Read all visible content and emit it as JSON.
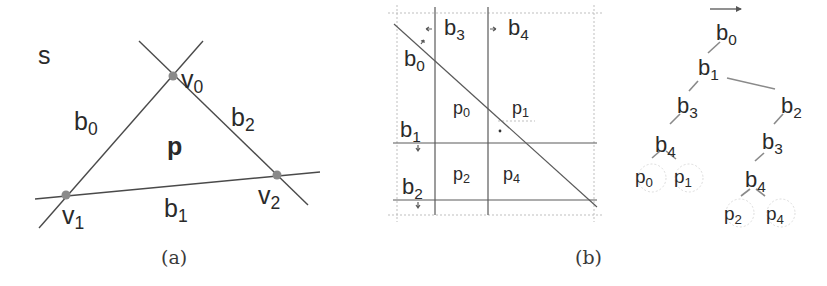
{
  "panel_a": {
    "caption": "(a)",
    "region_label": "s",
    "polygon_label": "p",
    "vertices": [
      {
        "name": "v",
        "sub": "0",
        "x": 173,
        "y": 76,
        "lx": 181,
        "ly": 88
      },
      {
        "name": "v",
        "sub": "1",
        "x": 66,
        "y": 195,
        "lx": 62,
        "ly": 224
      },
      {
        "name": "v",
        "sub": "2",
        "x": 277,
        "y": 175,
        "lx": 258,
        "ly": 204
      }
    ],
    "edges": [
      {
        "name": "b",
        "sub": "0",
        "lx": 74,
        "ly": 130
      },
      {
        "name": "b",
        "sub": "1",
        "lx": 164,
        "ly": 217
      },
      {
        "name": "b",
        "sub": "2",
        "lx": 231,
        "ly": 126
      }
    ]
  },
  "panel_b": {
    "caption": "(b)",
    "split_labels": [
      {
        "name": "b",
        "sub": "3",
        "lx": 444,
        "ly": 35
      },
      {
        "name": "b",
        "sub": "4",
        "lx": 508,
        "ly": 35
      },
      {
        "name": "b",
        "sub": "0",
        "lx": 404,
        "ly": 66
      },
      {
        "name": "b",
        "sub": "1",
        "lx": 400,
        "ly": 137
      },
      {
        "name": "b",
        "sub": "2",
        "lx": 402,
        "ly": 194
      }
    ],
    "cell_labels": [
      {
        "name": "p",
        "sub": "0",
        "lx": 453,
        "ly": 114
      },
      {
        "name": "p",
        "sub": "1",
        "lx": 512,
        "ly": 114
      },
      {
        "name": "p",
        "sub": "2",
        "lx": 453,
        "ly": 180
      },
      {
        "name": "p",
        "sub": "4",
        "lx": 503,
        "ly": 180
      }
    ]
  },
  "tree": {
    "root_arrow": "→",
    "nodes": [
      {
        "id": "b0",
        "name": "b",
        "sub": "0",
        "x": 734,
        "y": 34
      },
      {
        "id": "b1",
        "name": "b",
        "sub": "1",
        "x": 706,
        "y": 71
      },
      {
        "id": "b3L",
        "name": "b",
        "sub": "3",
        "x": 686,
        "y": 110
      },
      {
        "id": "b4L",
        "name": "b",
        "sub": "4",
        "x": 666,
        "y": 150
      },
      {
        "id": "p0",
        "name": "p",
        "sub": "0",
        "x": 644,
        "y": 180,
        "leaf": true
      },
      {
        "id": "p1",
        "name": "p",
        "sub": "1",
        "x": 684,
        "y": 180,
        "leaf": true
      },
      {
        "id": "b2",
        "name": "b",
        "sub": "2",
        "x": 790,
        "y": 110
      },
      {
        "id": "b3R",
        "name": "b",
        "sub": "3",
        "x": 770,
        "y": 147
      },
      {
        "id": "b4R",
        "name": "b",
        "sub": "4",
        "x": 756,
        "y": 187
      },
      {
        "id": "p2",
        "name": "p",
        "sub": "2",
        "x": 734,
        "y": 217,
        "leaf": true
      },
      {
        "id": "p4",
        "name": "p",
        "sub": "4",
        "x": 776,
        "y": 217,
        "leaf": true
      }
    ]
  }
}
